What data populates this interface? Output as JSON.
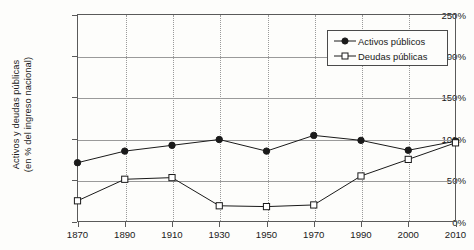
{
  "chart_data": {
    "type": "line",
    "title": "",
    "xlabel": "",
    "ylabel_line1": "Activos y deudas públicas",
    "ylabel_line2": "(en % del ingreso nacional)",
    "categories": [
      "1870",
      "1890",
      "1910",
      "1930",
      "1950",
      "1970",
      "1990",
      "2000",
      "2010"
    ],
    "ylim": [
      0,
      250
    ],
    "ytick_labels": [
      "0%",
      "50%",
      "100%",
      "150%",
      "200%",
      "250%"
    ],
    "ytick_values": [
      0,
      50,
      100,
      150,
      200,
      250
    ],
    "grid": "horizontal-solid-and-vertical-dotted",
    "legend_position": "top-right",
    "series": [
      {
        "name": "Activos públicos",
        "marker": "filled-circle",
        "color": "#1a1a1a",
        "values": [
          71,
          85,
          92,
          99,
          85,
          104,
          98,
          86,
          97
        ]
      },
      {
        "name": "Deudas públicas",
        "marker": "open-square",
        "color": "#1a1a1a",
        "values": [
          25,
          51,
          53,
          19,
          18,
          20,
          55,
          75,
          95
        ]
      }
    ]
  },
  "legend": {
    "items": [
      {
        "label": "Activos públicos",
        "marker": "filled-circle"
      },
      {
        "label": "Deudas públicas",
        "marker": "open-square"
      }
    ]
  },
  "colors": {
    "axis": "#5a5a5a",
    "grid": "#9a9a9a",
    "series": "#1a1a1a",
    "background": "#fdfdfb"
  }
}
